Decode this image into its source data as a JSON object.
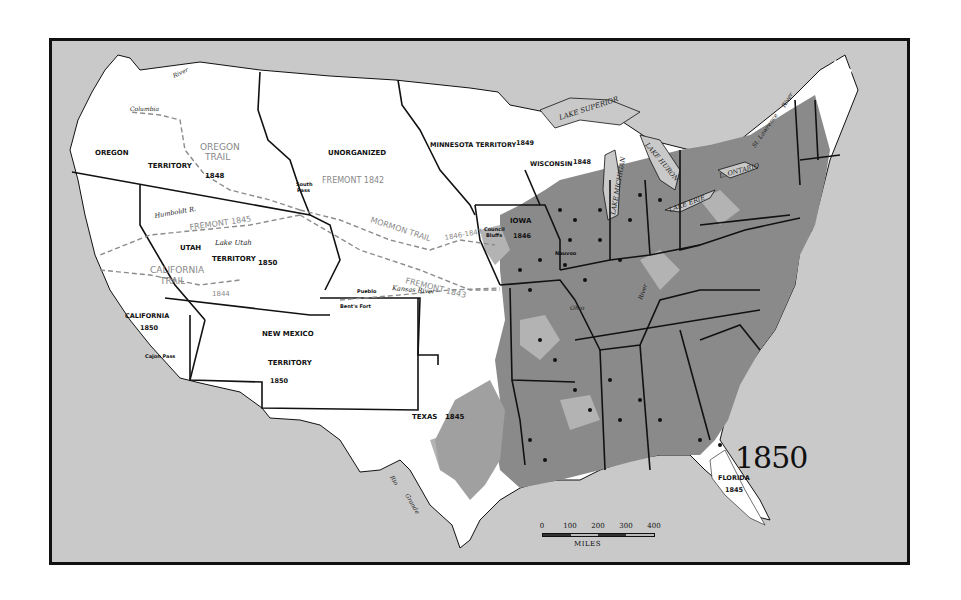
{
  "map": {
    "title_year": "1850",
    "colors": {
      "water_foreign": "#c9c9c9",
      "us_land": "#ffffff",
      "settled_dense": "#8a8a8a",
      "settled_light": "#b3b3b3",
      "border": "#111111",
      "trail": "#8c8c8c"
    },
    "territories": [
      {
        "name": "OREGON",
        "sub": "TERRITORY",
        "year": "1848"
      },
      {
        "name": "UNORGANIZED"
      },
      {
        "name": "MINNESOTA TERRITORY",
        "year": "1849"
      },
      {
        "name": "WISCONSIN",
        "year": "1848"
      },
      {
        "name": "IOWA",
        "year": "1846"
      },
      {
        "name": "UTAH",
        "sub": "TERRITORY",
        "year": "1850"
      },
      {
        "name": "CALIFORNIA",
        "year": "1850"
      },
      {
        "name": "NEW MEXICO",
        "sub": "TERRITORY",
        "year": "1850"
      },
      {
        "name": "TEXAS",
        "year": "1845"
      },
      {
        "name": "FLORIDA",
        "year": "1845"
      }
    ],
    "trails": [
      {
        "name": "OREGON",
        "name2": "TRAIL"
      },
      {
        "name": "FREMONT 1842"
      },
      {
        "name": "FREMONT 1843"
      },
      {
        "name": "FREMONT 1845"
      },
      {
        "name": "MORMON TRAIL",
        "years": "1846-1847"
      },
      {
        "name": "CALIFORNIA",
        "name2": "TRAIL"
      },
      {
        "name": "1844"
      }
    ],
    "places": {
      "south_pass": "South",
      "south_pass2": "Pass",
      "council_bluffs": "Council",
      "council_bluffs2": "Bluffs",
      "nauvoo": "Nauvoo",
      "pueblo": "Pueblo",
      "bents_fort": "Bent's Fort",
      "cajon_pass": "Cajon Pass",
      "lake_utah": "Lake Utah"
    },
    "water": {
      "columbia": "Columbia",
      "river": "River",
      "humboldt": "Humboldt R.",
      "kansas": "Kansas River",
      "ohio": "Ohio",
      "ohio_river": "River",
      "rio": "Rio",
      "grande": "Grande",
      "st_lawrence": "St. Lawrence",
      "st_lawrence_river": "River",
      "lake_superior": "LAKE SUPERIOR",
      "lake_michigan": "LAKE MICHIGAN",
      "lake_huron": "LAKE HURON",
      "lake_erie": "LAKE ERIE",
      "lake_ontario": "L. ONTARIO"
    },
    "scale": {
      "ticks": [
        "0",
        "100",
        "200",
        "300",
        "400"
      ],
      "unit": "MILES"
    }
  }
}
